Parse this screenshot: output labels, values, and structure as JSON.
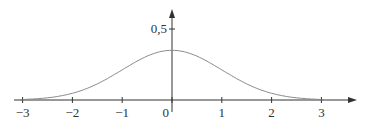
{
  "chart_data": {
    "type": "line",
    "title": "",
    "xlabel": "",
    "ylabel": "",
    "function": "normal density (bell curve), mean 0",
    "x_ticks": [
      -3,
      -2,
      -1,
      0,
      1,
      2,
      3
    ],
    "x_tick_labels": [
      "−3",
      "−2",
      "−1",
      "0",
      "1",
      "2",
      "3"
    ],
    "y_ticks": [
      0.5
    ],
    "y_tick_labels": [
      "0,5"
    ],
    "xlim": [
      -3.1,
      3.6
    ],
    "ylim": [
      0,
      0.63
    ],
    "peak": {
      "x": 0,
      "y": 0.35
    },
    "x": [
      -3,
      -2.5,
      -2,
      -1.5,
      -1,
      -0.5,
      0,
      0.5,
      1,
      1.5,
      2,
      2.5,
      3
    ],
    "values": [
      0.004,
      0.015,
      0.047,
      0.114,
      0.212,
      0.309,
      0.35,
      0.309,
      0.212,
      0.114,
      0.047,
      0.015,
      0.004
    ],
    "grid": false,
    "legend": null,
    "colors": {
      "curve": "#8a8a8a",
      "axes": "#333333"
    }
  }
}
